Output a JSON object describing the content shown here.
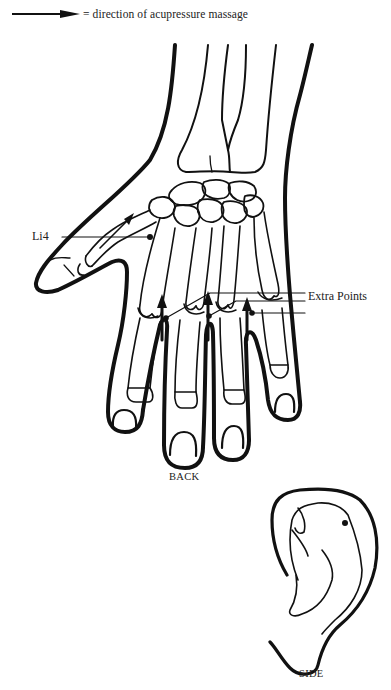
{
  "legend": {
    "icon": "arrow-right-icon",
    "text": "= direction of acupressure massage"
  },
  "hand_view": {
    "caption": "BACK",
    "points": [
      {
        "label": "Li4",
        "x": 150,
        "y": 237
      },
      {
        "label": "Extra Points",
        "markers": [
          {
            "x": 192,
            "y": 316
          },
          {
            "x": 209,
            "y": 313
          },
          {
            "x": 255,
            "y": 313
          }
        ]
      }
    ],
    "massage_arrows": 4
  },
  "ear_view": {
    "caption": "SIDE",
    "point": {
      "x": 345,
      "y": 523
    }
  },
  "colors": {
    "ink": "#111111",
    "background": "#ffffff"
  }
}
